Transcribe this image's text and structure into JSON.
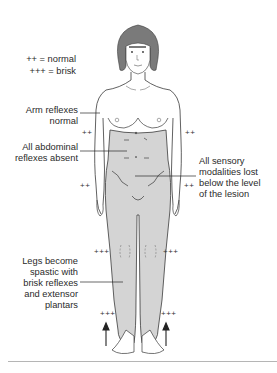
{
  "diagram": {
    "colors": {
      "shaded_region": "#d4d4d4",
      "outline": "#3a3a3a",
      "hair": "#7a7a7a",
      "background": "#ffffff",
      "rule": "#b5b5b5"
    },
    "legend": {
      "normal": "++ = normal",
      "brisk": "+++ = brisk"
    },
    "annotations": {
      "arm": [
        "Arm reflexes",
        "normal"
      ],
      "abdominal": [
        "All abdominal",
        "reflexes absent"
      ],
      "sensory": [
        "All sensory",
        "modalities lost",
        "below the level",
        "of the lesion"
      ],
      "legs": [
        "Legs become",
        "spastic with",
        "brisk reflexes",
        "and extensor",
        "plantars"
      ]
    },
    "reflex_marks": {
      "biceps_left": "++",
      "biceps_right": "++",
      "wrist_left": "++",
      "wrist_right": "++",
      "knee_left": "+++",
      "knee_right": "+++",
      "ankle_left": "+++",
      "ankle_right": "+++"
    },
    "abdominal_marks": [
      "–",
      "–",
      "–",
      "–"
    ],
    "plantar_arrows": [
      "up-arrow",
      "up-arrow"
    ]
  }
}
